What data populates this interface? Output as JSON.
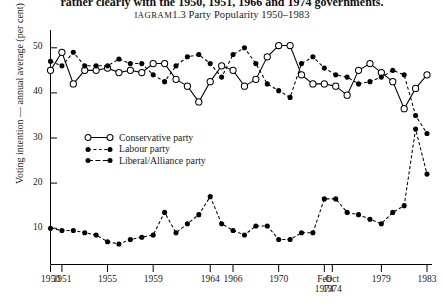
{
  "page": {
    "cut_text_top": "rather clearly with the 1950, 1951, 1966 and 1974 governments."
  },
  "figure": {
    "label": "Diagram 1.3",
    "label_prefix": "D",
    "label_rest": "IAGRAM",
    "title_main": "1.3  Party Popularity 1950–1983",
    "full_title": "Diagram 1.3 Party Popularity 1950–1983"
  },
  "axes": {
    "y_axis_title": "Voting intention — annual average (per cent)",
    "y_ticks": [
      10,
      20,
      30,
      40,
      50
    ],
    "y_min": 0,
    "y_max": 55,
    "x_ticks": [
      {
        "line1": "1950",
        "line2": "",
        "year": 1950
      },
      {
        "line1": "1951",
        "line2": "",
        "year": 1951
      },
      {
        "line1": "1955",
        "line2": "",
        "year": 1955
      },
      {
        "line1": "1959",
        "line2": "",
        "year": 1959
      },
      {
        "line1": "1964",
        "line2": "",
        "year": 1964
      },
      {
        "line1": "1966",
        "line2": "",
        "year": 1966
      },
      {
        "line1": "1970",
        "line2": "",
        "year": 1970
      },
      {
        "line1": "Feb",
        "line2": "1974",
        "year": 1974
      },
      {
        "line1": "Oct",
        "line2": "1974",
        "year": 1974.7
      },
      {
        "line1": "1979",
        "line2": "",
        "year": 1979
      },
      {
        "line1": "1983",
        "line2": "",
        "year": 1983
      }
    ]
  },
  "legend": {
    "position": "inside-left",
    "items": [
      {
        "label": "Conservative party",
        "marker": "open-circle",
        "line": "solid"
      },
      {
        "label": "Labour party",
        "marker": "filled-circle",
        "line": "dashed"
      },
      {
        "label": "Liberal/Alliance party",
        "marker": "filled-circle",
        "line": "dashed"
      }
    ]
  },
  "chart_data": {
    "type": "line",
    "xlabel": "",
    "ylabel": "Voting intention — annual average (per cent)",
    "ylim": [
      0,
      55
    ],
    "xlim": [
      1950,
      1983
    ],
    "grid": false,
    "legend_position": "inside-left",
    "x": [
      1950,
      1951,
      1952,
      1953,
      1954,
      1955,
      1956,
      1957,
      1958,
      1959,
      1960,
      1961,
      1962,
      1963,
      1964,
      1965,
      1966,
      1967,
      1968,
      1969,
      1970,
      1971,
      1972,
      1973,
      1974,
      1975,
      1976,
      1977,
      1978,
      1979,
      1980,
      1981,
      1982,
      1983
    ],
    "series": [
      {
        "name": "Conservative party",
        "marker": "open-circle",
        "line": "solid",
        "values": [
          45,
          49,
          42,
          45,
          45,
          45.5,
          44.5,
          45,
          44.5,
          46.5,
          46.5,
          43,
          41.5,
          38,
          42.5,
          46,
          45,
          41.5,
          43,
          48,
          50.5,
          50.5,
          44,
          42,
          42,
          41.5,
          39.5,
          45,
          46.5,
          44.5,
          42.5,
          36.5,
          41,
          44
        ]
      },
      {
        "name": "Labour party",
        "marker": "filled-circle",
        "line": "dashed",
        "values": [
          47,
          46,
          49,
          46,
          46,
          46,
          47.5,
          46.5,
          46.5,
          44,
          42.5,
          46,
          48,
          48.5,
          46.5,
          43.5,
          48.5,
          50,
          46.5,
          42,
          40.5,
          39,
          46.5,
          48,
          45.5,
          44,
          43.5,
          42,
          42.5,
          43.5,
          45,
          44,
          35,
          31
        ]
      },
      {
        "name": "Liberal/Alliance party",
        "marker": "filled-circle",
        "line": "dashed",
        "values": [
          10,
          9.5,
          9.5,
          9,
          8.5,
          7,
          6.5,
          7.5,
          8,
          8.5,
          13.5,
          9,
          11,
          13,
          17,
          11,
          9.5,
          8.5,
          10.5,
          10.5,
          7.5,
          7.5,
          9,
          9,
          16.5,
          16.5,
          13.5,
          13,
          12,
          11,
          13.5,
          15,
          32,
          22
        ]
      }
    ]
  }
}
